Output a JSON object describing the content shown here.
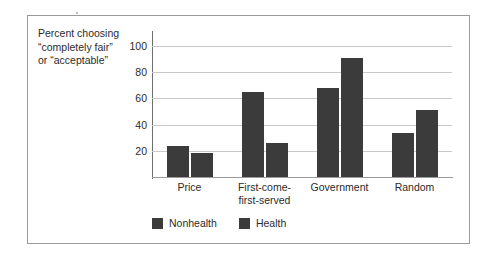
{
  "chart_data": {
    "type": "bar",
    "title": "",
    "subtitle": "",
    "xlabel": "",
    "ylabel": "Percent choosing\n“completely fair”\nor “acceptable”",
    "categories": [
      "Price",
      "First-come-\nfirst-served",
      "Government",
      "Random"
    ],
    "series": [
      {
        "name": "Nonhealth",
        "values": [
          24,
          65,
          68,
          34
        ],
        "color": "#3b3b3b"
      },
      {
        "name": "Health",
        "values": [
          18,
          26,
          91,
          51
        ],
        "color": "#3b3b3b"
      }
    ],
    "ylim": [
      0,
      110
    ],
    "yticks": [
      20,
      40,
      60,
      80,
      100
    ],
    "ytick_labels": [
      "20",
      "40",
      "60",
      "80",
      "100"
    ],
    "grid": true,
    "grid_axis": "y",
    "legend_position": "bottom-left",
    "legend_entries": [
      "Nonhealth",
      "Health"
    ]
  },
  "figure": {
    "frame_border_color": "#9a9a9a",
    "background_color": "#ffffff",
    "bar_color": "#3b3b3b",
    "gridline_color": "#c9c9c9",
    "axis_color": "#6f6f6f",
    "text_color": "#2b2b2b"
  }
}
